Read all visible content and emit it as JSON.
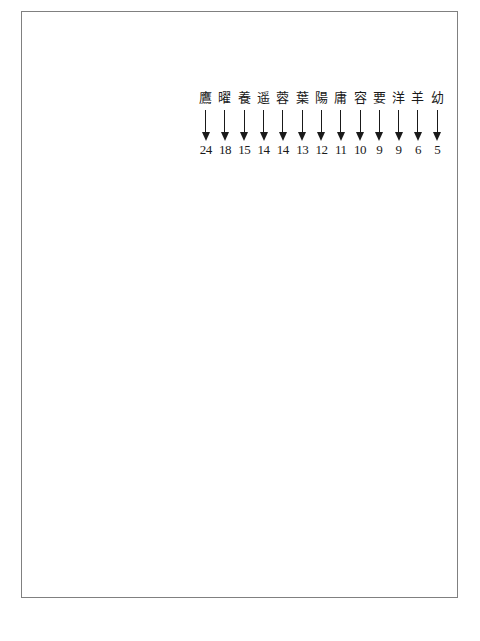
{
  "figure": {
    "type": "character-frequency-list",
    "columns": [
      {
        "char": "鷹",
        "count": "24"
      },
      {
        "char": "曜",
        "count": "18"
      },
      {
        "char": "養",
        "count": "15"
      },
      {
        "char": "遥",
        "count": "14"
      },
      {
        "char": "蓉",
        "count": "14"
      },
      {
        "char": "葉",
        "count": "13"
      },
      {
        "char": "陽",
        "count": "12"
      },
      {
        "char": "庸",
        "count": "11"
      },
      {
        "char": "容",
        "count": "10"
      },
      {
        "char": "要",
        "count": "9"
      },
      {
        "char": "洋",
        "count": "9"
      },
      {
        "char": "羊",
        "count": "6"
      },
      {
        "char": "幼",
        "count": "5"
      }
    ]
  },
  "icons": {
    "arrow": "arrow-down-icon"
  },
  "colors": {
    "border": "#808080",
    "text": "#1a1a1a",
    "background": "#ffffff"
  }
}
